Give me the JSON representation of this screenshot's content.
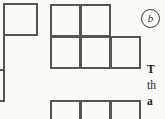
{
  "figure": {
    "label": {
      "text": "b",
      "style": "circled-italic-letter",
      "x": 141,
      "y": 9,
      "size": 19
    },
    "line_color": "#555555",
    "background_color": "#fbfaf7",
    "text_color": "#1e1e1e",
    "cell_size": 30,
    "shapes": [
      {
        "name": "left-polyomino-clipped",
        "description": "vertical polyomino clipped by the left edge of the image",
        "cells": [
          {
            "x": 3,
            "y": 3,
            "w": 35,
            "h": 33
          }
        ],
        "segments": [
          {
            "x": 3,
            "y": 36,
            "w": 2,
            "h": 66
          },
          {
            "x": 0,
            "y": 69,
            "w": 5,
            "h": 2
          },
          {
            "x": 0,
            "y": 100,
            "w": 5,
            "h": 2
          }
        ]
      },
      {
        "name": "middle-p-polyomino",
        "description": "two cells on the top row and three cells on the bottom row",
        "cells": [
          {
            "x": 50,
            "y": 4,
            "w": 31,
            "h": 33
          },
          {
            "x": 80,
            "y": 4,
            "w": 31,
            "h": 33
          },
          {
            "x": 50,
            "y": 36,
            "w": 31,
            "h": 33
          },
          {
            "x": 80,
            "y": 36,
            "w": 31,
            "h": 33
          },
          {
            "x": 110,
            "y": 36,
            "w": 31,
            "h": 33
          }
        ],
        "segments": []
      },
      {
        "name": "bottom-row-polyomino-clipped",
        "description": "horizontal row of three cells clipped by the bottom edge",
        "cells": [
          {
            "x": 50,
            "y": 100,
            "w": 31,
            "h": 26
          },
          {
            "x": 80,
            "y": 100,
            "w": 31,
            "h": 26
          },
          {
            "x": 110,
            "y": 100,
            "w": 31,
            "h": 26
          }
        ],
        "segments": []
      }
    ]
  },
  "body_text": {
    "x": 147,
    "y": 61,
    "lines": [
      {
        "text": "T",
        "bold": true
      },
      {
        "text": "th",
        "bold": false
      },
      {
        "text": "a",
        "bold": true
      }
    ]
  }
}
